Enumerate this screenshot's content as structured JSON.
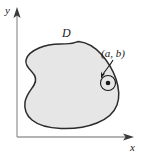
{
  "figure": {
    "type": "math-diagram",
    "background_color": "#ffffff"
  },
  "axes": {
    "x_label": "x",
    "y_label": "y",
    "axis_color": "#8c8c8c",
    "arrow_color": "#3a3a3a",
    "origin": {
      "x": 17,
      "y": 137
    },
    "x_axis_end": {
      "x": 132,
      "y": 137
    },
    "y_axis_end": {
      "x": 17,
      "y": 9
    }
  },
  "region": {
    "label": "D",
    "label_position": {
      "x": 62,
      "y": 37
    },
    "fill_color": "#e6e6e6",
    "stroke_color": "#2b2b2b",
    "stroke_width": 1.4
  },
  "point": {
    "label": "(a, b)",
    "label_position": {
      "x": 101,
      "y": 57
    },
    "center": {
      "x": 108,
      "y": 83
    },
    "dot_radius": 2.2,
    "neighborhood_radius": 7.5,
    "dot_color": "#1a1a1a",
    "circle_color": "#1a1a1a",
    "leader_color": "#1a1a1a"
  }
}
